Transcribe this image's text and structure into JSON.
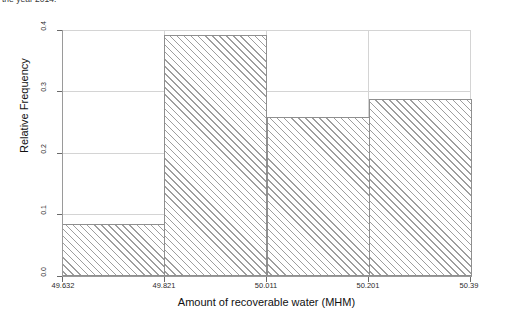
{
  "caption": {
    "text": "the year 2014."
  },
  "chart_data": {
    "type": "bar",
    "title": "",
    "subtitle": "",
    "xlabel": "Amount of recoverable water (MHM)",
    "ylabel": "Relative Frequency",
    "grid": true,
    "legend": false,
    "bin_edges": [
      49.632,
      49.821,
      50.011,
      50.201,
      50.39
    ],
    "categories": [
      "49.632–49.821",
      "49.821–50.011",
      "50.011–50.201",
      "50.201–50.39"
    ],
    "values": [
      0.085,
      0.392,
      0.258,
      0.288
    ],
    "xlim": [
      49.632,
      50.39
    ],
    "ylim": [
      0.0,
      0.4
    ],
    "xticks": [
      "49.632",
      "49.821",
      "50.011",
      "50.201",
      "50.39"
    ],
    "xtick_values": [
      49.632,
      49.821,
      50.011,
      50.201,
      50.39
    ],
    "yticks": [
      "0.0",
      "0.1",
      "0.2",
      "0.3",
      "0.4"
    ],
    "ytick_values": [
      0.0,
      0.1,
      0.2,
      0.3,
      0.4
    ],
    "bar_style": {
      "fill": "#ffffff",
      "hatch": "/",
      "hatch_color": "#9e9e9e",
      "edge_color": "#8f8f8f"
    },
    "colors": {
      "grid": "#d4d4d4",
      "axis": "#9a9a9a",
      "text": "#1a1a1a",
      "background": "#ffffff"
    }
  }
}
